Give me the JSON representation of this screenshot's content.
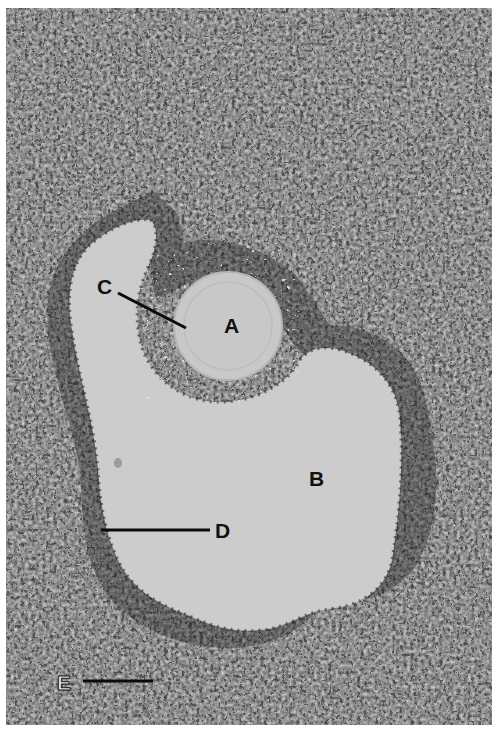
{
  "figure": {
    "background_color": "#ffffff",
    "tissue_dark_color": "#1c1c1c",
    "tissue_light_color": "#c8c8c8",
    "cavity_color": "#cfcfcf",
    "labels": [
      {
        "id": "A",
        "text": "A",
        "x": 224,
        "y": 315
      },
      {
        "id": "B",
        "text": "B",
        "x": 309,
        "y": 468
      },
      {
        "id": "C",
        "text": "C",
        "x": 97,
        "y": 276
      },
      {
        "id": "D",
        "text": "D",
        "x": 215,
        "y": 520
      },
      {
        "id": "E",
        "text": "E",
        "x": 57,
        "y": 672
      }
    ],
    "leader_lines": [
      {
        "label": "C",
        "x1": 118,
        "y1": 293,
        "x2": 186,
        "y2": 328
      },
      {
        "label": "D",
        "x1": 101,
        "y1": 530,
        "x2": 210,
        "y2": 530
      },
      {
        "label": "E",
        "x1": 83,
        "y1": 681,
        "x2": 153,
        "y2": 681
      }
    ]
  }
}
